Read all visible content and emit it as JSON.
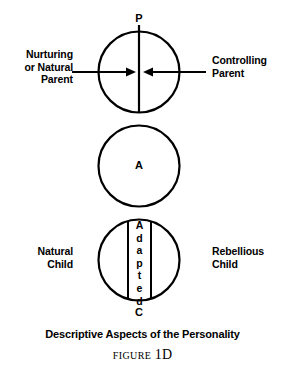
{
  "figure": {
    "title": "Descriptive Aspects of the Personality",
    "figure_word": "FIGURE",
    "figure_number": "1D",
    "ink_color": "#000000",
    "background_color": "#ffffff"
  },
  "ego_states": {
    "parent": {
      "letter": "P",
      "left_label": "Nurturing\nor Natural\nParent",
      "right_label": "Controlling\nParent"
    },
    "adult": {
      "letter": "A"
    },
    "child": {
      "letter": "C",
      "left_label": "Natural\nChild",
      "right_label": "Rebellious\nChild",
      "band_label_letters": [
        "A",
        "d",
        "a",
        "p",
        "t",
        "e",
        "d"
      ]
    }
  },
  "arrows": {
    "left_arrow_direction": "right",
    "right_arrow_direction": "left"
  },
  "diagram_geometry": {
    "circle_center_x": 139,
    "circle_radius": 41,
    "parent_center_y": 72,
    "adult_center_y": 166,
    "child_center_y": 260,
    "divider_line_x": 139,
    "band_left_x": 128,
    "band_right_x": 151
  }
}
